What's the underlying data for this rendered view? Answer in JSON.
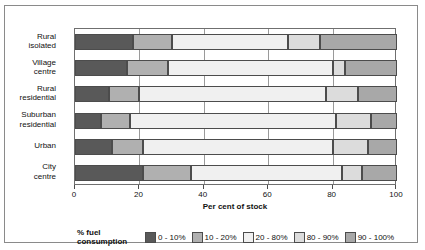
{
  "chart_data": {
    "type": "bar",
    "orientation": "horizontal",
    "stacked": true,
    "title": "",
    "xlabel": "Per cent of stock",
    "ylabel": "",
    "xlim": [
      0,
      100
    ],
    "xticks": [
      0,
      20,
      40,
      60,
      80,
      100
    ],
    "grid": true,
    "legend_position": "bottom",
    "legend_title": "% fuel\nconsumption",
    "categories": [
      "Rural\nisolated",
      "Village\ncentre",
      "Rural\nresidential",
      "Suburban\nresidential",
      "Urban",
      "City\ncentre"
    ],
    "series": [
      {
        "name": "0 - 10%",
        "color": "#595959",
        "values": [
          18,
          16,
          10.5,
          8,
          11.5,
          21
        ]
      },
      {
        "name": "10 - 20%",
        "color": "#b0b0b0",
        "values": [
          12,
          13,
          9.5,
          9,
          9.5,
          15
        ]
      },
      {
        "name": "20 - 80%",
        "color": "#f0f0f0",
        "values": [
          36,
          51,
          58,
          64,
          59,
          47
        ]
      },
      {
        "name": "80 - 90%",
        "color": "#dcdcdc",
        "values": [
          10,
          4,
          10,
          11,
          11,
          6
        ]
      },
      {
        "name": "90 - 100%",
        "color": "#a8a8a8",
        "values": [
          24,
          16,
          12,
          8,
          9,
          11
        ]
      }
    ]
  },
  "axis": {
    "tick_labels": [
      "0",
      "20",
      "40",
      "60",
      "80",
      "100"
    ],
    "title": "Per cent of stock"
  },
  "legend": {
    "title": "% fuel\nconsumption",
    "items": [
      {
        "label": "0 - 10%",
        "color": "#595959"
      },
      {
        "label": "10 - 20%",
        "color": "#b0b0b0"
      },
      {
        "label": "20 - 80%",
        "color": "#f0f0f0"
      },
      {
        "label": "80 - 90%",
        "color": "#dcdcdc"
      },
      {
        "label": "90 - 100%",
        "color": "#a8a8a8"
      }
    ]
  }
}
